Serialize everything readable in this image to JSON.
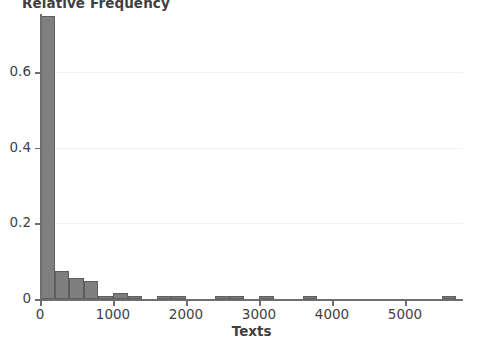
{
  "chart_data": {
    "type": "bar",
    "title": "Relative Frequency",
    "xlabel": "Texts",
    "ylabel": "",
    "xlim": [
      -60,
      5800
    ],
    "ylim": [
      0,
      0.755
    ],
    "grid": true,
    "legend": "none",
    "bin_width": 200,
    "x_ticks": [
      0,
      1000,
      2000,
      3000,
      4000,
      5000
    ],
    "x_tick_labels": [
      "0",
      "1000",
      "2000",
      "3000",
      "4000",
      "5000"
    ],
    "y_ticks": [
      0,
      0.2,
      0.4,
      0.6
    ],
    "y_tick_labels": [
      "0",
      "0.2",
      "0.4",
      "0.6"
    ],
    "bar_color": "#7f7f7f",
    "bar_edge_color": "#5e5e5e",
    "axis_color": "#6e6e6e",
    "grid_color": "#f2f2f2",
    "background": "#ffffff",
    "bins": [
      {
        "x0": 0,
        "x1": 200,
        "value": 0.748
      },
      {
        "x0": 200,
        "x1": 400,
        "value": 0.073
      },
      {
        "x0": 400,
        "x1": 600,
        "value": 0.055
      },
      {
        "x0": 600,
        "x1": 800,
        "value": 0.047
      },
      {
        "x0": 800,
        "x1": 1000,
        "value": 0.009
      },
      {
        "x0": 1000,
        "x1": 1200,
        "value": 0.017
      },
      {
        "x0": 1200,
        "x1": 1400,
        "value": 0.009
      },
      {
        "x0": 1600,
        "x1": 1800,
        "value": 0.009
      },
      {
        "x0": 1800,
        "x1": 2000,
        "value": 0.009
      },
      {
        "x0": 2400,
        "x1": 2600,
        "value": 0.009
      },
      {
        "x0": 2600,
        "x1": 2800,
        "value": 0.009
      },
      {
        "x0": 3000,
        "x1": 3200,
        "value": 0.009
      },
      {
        "x0": 3600,
        "x1": 3800,
        "value": 0.009
      },
      {
        "x0": 5500,
        "x1": 5700,
        "value": 0.009
      }
    ]
  }
}
